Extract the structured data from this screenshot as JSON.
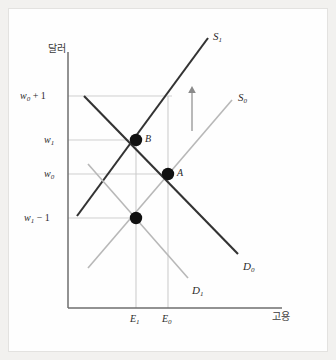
{
  "figure": {
    "kind": "labor-market-supply-demand-diagram",
    "background_color": "#f2f1ef",
    "plot_background_color": "#fefefe",
    "border_color": "#e3e2e0"
  },
  "axes": {
    "y_title": "달러",
    "x_title": "고용",
    "axis_color": "#6e6e6e",
    "gridline_color": "#cfcfcf",
    "dropline_color": "#c9c9c9"
  },
  "y_ticks": [
    {
      "label": "w₀ + 1",
      "base": "w",
      "sub": "0",
      "op": " + 1",
      "y": 96
    },
    {
      "label": "w₁",
      "base": "w",
      "sub": "1",
      "op": "",
      "y": 140
    },
    {
      "label": "w₀",
      "base": "w",
      "sub": "0",
      "op": "",
      "y": 174
    },
    {
      "label": "w₁ − 1",
      "base": "w",
      "sub": "1",
      "op": " − 1",
      "y": 218
    }
  ],
  "x_ticks": [
    {
      "label": "E₁",
      "base": "E",
      "sub": "1",
      "x": 136
    },
    {
      "label": "E₀",
      "base": "E",
      "sub": "0",
      "x": 168
    }
  ],
  "curves": [
    {
      "name": "supply-shifted",
      "label": "S₁",
      "base": "S",
      "sub": "1",
      "color": "#333333",
      "width": 2.1,
      "label_x": 213,
      "label_y": 31
    },
    {
      "name": "supply-original",
      "label": "S₀",
      "base": "S",
      "sub": "0",
      "color": "#b8b8b8",
      "width": 1.6,
      "label_x": 238,
      "label_y": 92
    },
    {
      "name": "demand-original",
      "label": "D₀",
      "base": "D",
      "sub": "0",
      "color": "#333333",
      "width": 2.1,
      "label_x": 243,
      "label_y": 261
    },
    {
      "name": "demand-shifted",
      "label": "D₁",
      "base": "D",
      "sub": "1",
      "color": "#b8b8b8",
      "width": 1.6,
      "label_x": 192,
      "label_y": 285
    }
  ],
  "points": [
    {
      "name": "equilibrium-b",
      "label": "B",
      "x": 136,
      "y": 140,
      "label_x": 145,
      "label_y": 134
    },
    {
      "name": "equilibrium-a",
      "label": "A",
      "x": 168,
      "y": 174,
      "label_x": 177,
      "label_y": 168
    },
    {
      "name": "unlabeled-point",
      "label": "",
      "x": 136,
      "y": 218,
      "label_x": 0,
      "label_y": 0
    }
  ],
  "annotations": [
    {
      "name": "shift-arrow",
      "icon": "up-arrow-icon",
      "x": 192,
      "y_top": 88,
      "y_bottom": 131,
      "color": "#8a8a8a"
    }
  ]
}
